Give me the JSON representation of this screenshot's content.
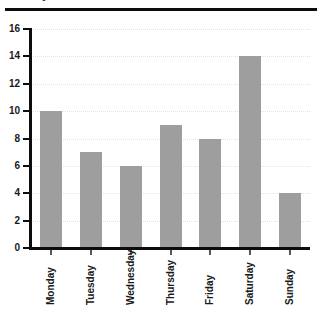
{
  "title_fragment": "Daily Totals",
  "chart_data": {
    "type": "bar",
    "title": "",
    "xlabel": "",
    "ylabel": "",
    "categories": [
      "Monday",
      "Tuesday",
      "Wednesday",
      "Thursday",
      "Friday",
      "Saturday",
      "Sunday"
    ],
    "values": [
      10,
      7,
      6,
      9,
      8,
      14,
      4
    ],
    "ylim": [
      0,
      16
    ],
    "ytick_labels": [
      "0",
      "2",
      "4",
      "6",
      "8",
      "10",
      "12",
      "14",
      "16"
    ],
    "ytick_values": [
      0,
      2,
      4,
      6,
      8,
      10,
      12,
      14,
      16
    ],
    "grid": true,
    "grid_axis": "y",
    "legend": false,
    "bar_color": "#9e9e9e",
    "axis_color": "#0d0d0d",
    "grid_color": "#e2e2e2",
    "label_rotation": -90
  }
}
